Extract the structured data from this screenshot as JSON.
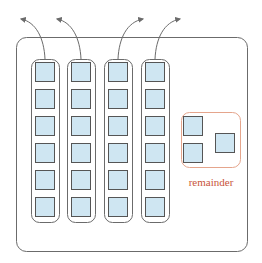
{
  "diagram": {
    "colors": {
      "outer_border": "#6b6b6b",
      "column_border": "#6b6b6b",
      "block_fill": "#cfe6f2",
      "block_border": "#555555",
      "arrow": "#6b6b6b",
      "remainder_border": "#e5a58c",
      "remainder_text": "#c8553a"
    },
    "outer_box": {
      "x": 16,
      "y": 37,
      "w": 232,
      "h": 215,
      "r": 10
    },
    "columns": [
      {
        "id": "column-1",
        "x": 31,
        "arrow_dir": "left",
        "blocks": 6
      },
      {
        "id": "column-2",
        "x": 67,
        "arrow_dir": "left",
        "blocks": 6
      },
      {
        "id": "column-3",
        "x": 104,
        "arrow_dir": "right",
        "blocks": 6
      },
      {
        "id": "column-4",
        "x": 141,
        "arrow_dir": "right",
        "blocks": 6
      }
    ],
    "remainder": {
      "label": "remainder",
      "box": {
        "x": 181,
        "y": 112,
        "w": 60,
        "h": 56,
        "r": 8
      },
      "blocks": [
        {
          "x": 183,
          "y": 116
        },
        {
          "x": 183,
          "y": 143
        },
        {
          "x": 215,
          "y": 133
        }
      ]
    }
  }
}
